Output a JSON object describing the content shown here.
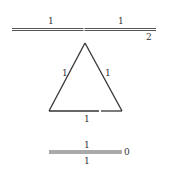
{
  "diagram": {
    "top_edge": {
      "left_label": "1",
      "right_label": "1",
      "end_label": "2"
    },
    "triangle": {
      "left_side_label": "1",
      "right_side_label": "1",
      "base_label": "1"
    },
    "bottom_edge": {
      "top_label": "1",
      "bottom_label": "1",
      "end_label": "0"
    },
    "colors": {
      "stroke": "#333333",
      "background": "#ffffff"
    }
  }
}
